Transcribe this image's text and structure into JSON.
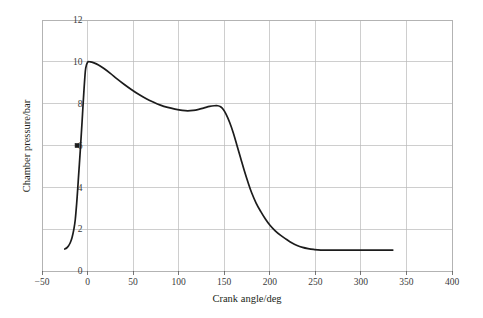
{
  "figure": {
    "background_color": "#ffffff",
    "line_color": "#1c1c1c",
    "grid_color": "#b9b9b9",
    "frame_color": "#b0b0b0",
    "text_color": "#231f20"
  },
  "chart_data": {
    "type": "line",
    "title": "",
    "xlabel": "Crank angle/deg",
    "ylabel": "Chamber pressure/bar",
    "xlim": [
      -50,
      400
    ],
    "ylim": [
      0,
      12
    ],
    "xticks": [
      -50,
      0,
      50,
      100,
      150,
      200,
      250,
      300,
      350,
      400
    ],
    "xtick_labels": [
      "−50",
      "0",
      "50",
      "100",
      "150",
      "200",
      "250",
      "300",
      "350",
      "400"
    ],
    "yticks": [
      0,
      2,
      4,
      6,
      8,
      10,
      12
    ],
    "ytick_labels": [
      "0",
      "2",
      "4",
      "6",
      "8",
      "10",
      "12"
    ],
    "grid": true,
    "legend": false,
    "legend_position": "none",
    "series": [
      {
        "name": "Chamber pressure",
        "x": [
          -25,
          -23,
          -21,
          -19,
          -17,
          -15,
          -13.5,
          -12,
          -11,
          -10,
          -9,
          -8,
          -7,
          -6,
          -5,
          -4,
          -3,
          -2,
          0,
          3,
          7,
          12,
          18,
          25,
          32,
          40,
          48,
          56,
          64,
          72,
          80,
          88,
          96,
          104,
          110,
          116,
          122,
          128,
          134,
          139,
          143,
          146,
          149,
          152,
          156,
          160,
          164,
          168,
          172,
          176,
          180,
          185,
          190,
          195,
          200,
          206,
          212,
          218,
          224,
          230,
          236,
          242,
          248,
          256,
          270,
          290,
          310,
          325,
          335
        ],
        "y": [
          1.05,
          1.1,
          1.2,
          1.35,
          1.6,
          2.0,
          2.45,
          3.2,
          3.8,
          4.45,
          5.1,
          5.75,
          6.45,
          7.15,
          7.9,
          8.6,
          9.25,
          9.7,
          9.98,
          10.0,
          9.95,
          9.85,
          9.68,
          9.45,
          9.2,
          8.93,
          8.68,
          8.45,
          8.25,
          8.08,
          7.93,
          7.82,
          7.74,
          7.68,
          7.66,
          7.68,
          7.73,
          7.8,
          7.87,
          7.9,
          7.9,
          7.85,
          7.72,
          7.5,
          7.1,
          6.6,
          6.0,
          5.4,
          4.8,
          4.25,
          3.75,
          3.25,
          2.85,
          2.5,
          2.2,
          1.92,
          1.7,
          1.52,
          1.35,
          1.22,
          1.13,
          1.07,
          1.03,
          1.0,
          1.0,
          1.0,
          1.0,
          1.0,
          1.0
        ]
      }
    ],
    "markers": [
      {
        "x": -11.5,
        "y": 6.0,
        "label": ""
      }
    ],
    "annotations": {
      "peak_pressure_bar": 10.0,
      "peak_crank_angle_deg": 0,
      "local_min_pressure_bar": 7.66,
      "local_min_crank_angle_deg": 110,
      "secondary_peak_pressure_bar": 7.9,
      "secondary_peak_crank_angle_deg": 143,
      "plateau_pressure_bar": 1.0,
      "series_start_crank_angle_deg": -25,
      "series_end_crank_angle_deg": 335
    }
  }
}
